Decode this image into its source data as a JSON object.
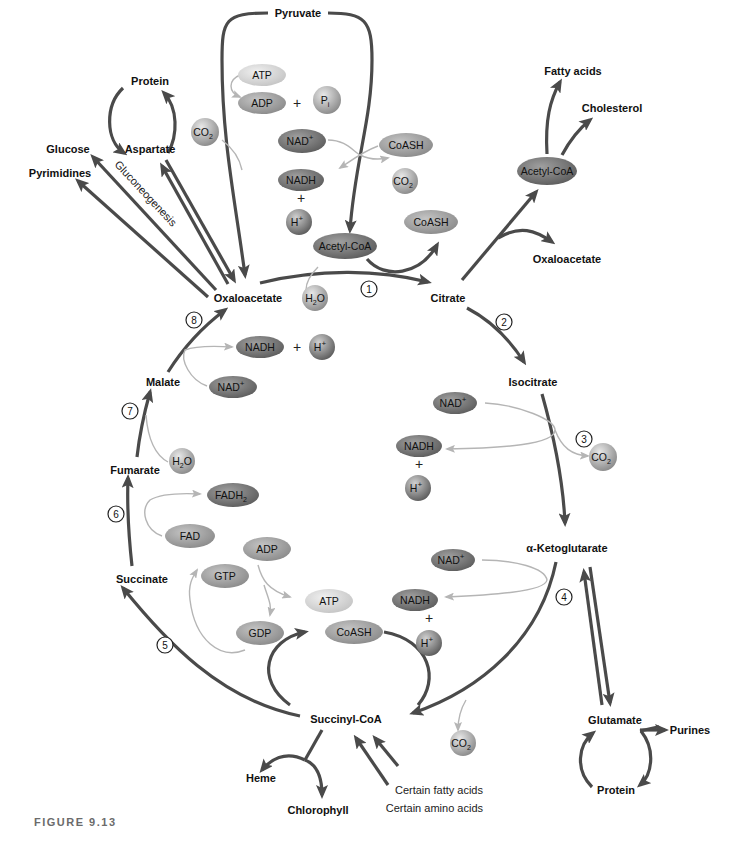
{
  "figure": {
    "caption": "FIGURE 9.13",
    "type": "Citric acid cycle with biosynthetic connections"
  },
  "colors": {
    "main_arrow": "#4a4a4a",
    "side_arrow": "#b5b5b5",
    "dark_oval": "#6e6e6e",
    "medium_oval": "#9a9a9a",
    "light_oval": "#d2d2d2",
    "text": "#111111",
    "caption": "#6b6b6b"
  },
  "intermediates": {
    "oxaloacetate": "Oxaloacetate",
    "citrate": "Citrate",
    "isocitrate": "Isocitrate",
    "ketoglutarate": "α-Ketoglutarate",
    "succinyl_coa": "Succinyl-CoA",
    "succinate": "Succinate",
    "fumarate": "Fumarate",
    "malate": "Malate"
  },
  "steps": [
    "1",
    "2",
    "3",
    "4",
    "5",
    "6",
    "7",
    "8"
  ],
  "top": {
    "pyruvate": "Pyruvate",
    "atp": "ATP",
    "adp": "ADP",
    "plus1": "+",
    "pi": "P",
    "pi_sub": "i",
    "co2_left": "CO",
    "co2_left_sub": "2",
    "nad": "NAD",
    "nad_sup": "+",
    "coash_in": "CoASH",
    "nadh": "NADH",
    "plus2": "+",
    "co2_right": "CO",
    "co2_right_sub": "2",
    "h": "H",
    "h_sup": "+",
    "acetyl_coa": "Acetyl-CoA",
    "coash_out": "CoASH",
    "h2o": "H",
    "h2o_sub": "2",
    "h2o_o": "O"
  },
  "left_branch": {
    "protein": "Protein",
    "aspartate": "Aspartate",
    "glucose": "Glucose",
    "pyrimidines": "Pyrimidines",
    "gluconeogenesis": "Gluconeogenesis"
  },
  "right_branch": {
    "fatty_acids": "Fatty acids",
    "cholesterol": "Cholesterol",
    "acetyl_coa": "Acetyl-CoA",
    "oxaloacetate": "Oxaloacetate"
  },
  "step3": {
    "nad": "NAD",
    "nad_sup": "+",
    "nadh": "NADH",
    "plus": "+",
    "h": "H",
    "h_sup": "+",
    "co2": "CO",
    "co2_sub": "2"
  },
  "step4": {
    "nad": "NAD",
    "nad_sup": "+",
    "nadh": "NADH",
    "plus": "+",
    "h": "H",
    "h_sup": "+",
    "coash": "CoASH",
    "co2": "CO",
    "co2_sub": "2"
  },
  "step5": {
    "gtp": "GTP",
    "adp": "ADP",
    "atp": "ATP",
    "gdp": "GDP"
  },
  "step6": {
    "fadh2": "FADH",
    "fadh2_sub": "2",
    "fad": "FAD"
  },
  "step7": {
    "h2o": "H",
    "h2o_sub": "2",
    "h2o_o": "O"
  },
  "step8": {
    "nadh": "NADH",
    "plus": "+",
    "h": "H",
    "h_sup": "+",
    "nad": "NAD",
    "nad_sup": "+"
  },
  "bottom_branch": {
    "heme": "Heme",
    "chlorophyll": "Chlorophyll",
    "fatty_acids": "Certain fatty acids",
    "amino_acids": "Certain amino acids"
  },
  "glutamate_branch": {
    "glutamate": "Glutamate",
    "purines": "Purines",
    "protein": "Protein"
  }
}
